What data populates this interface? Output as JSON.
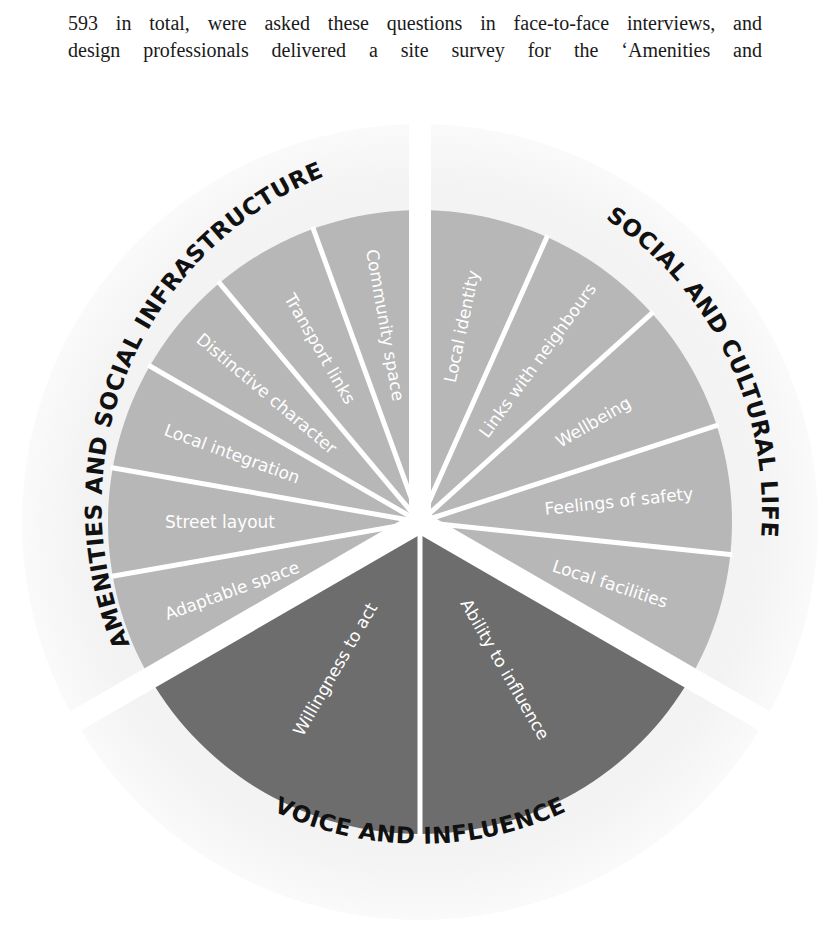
{
  "intro_text": {
    "line_1": "593 in total, were asked these questions in face-to-face interviews, and",
    "line_2": "design professionals delivered a site survey for the ‘Amenities and"
  },
  "diagram": {
    "type": "segmented-wheel",
    "colors": {
      "background_ring": "#f2f2f2",
      "light_segment": "#b7b7b7",
      "dark_segment": "#6d6d6d",
      "separator": "#ffffff",
      "label_text": "#ffffff",
      "category_text": "#111111"
    },
    "categories": [
      {
        "name": "AMENITIES AND SOCIAL INFRASTRUCTURE",
        "segments": [
          "Adaptable space",
          "Street layout",
          "Local integration",
          "Distinctive character",
          "Transport links",
          "Community space"
        ]
      },
      {
        "name": "SOCIAL AND CULTURAL LIFE",
        "segments": [
          "Local identity",
          "Links with neighbours",
          "Wellbeing",
          "Feelings of safety",
          "Local facilities"
        ]
      },
      {
        "name": "VOICE AND INFLUENCE",
        "segments": [
          "Ability to influence",
          "Willingness to act"
        ]
      }
    ]
  }
}
